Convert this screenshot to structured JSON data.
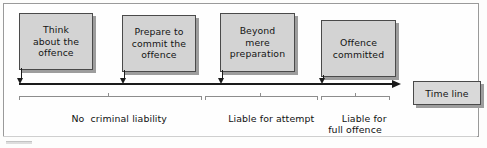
{
  "diagram": {
    "frame": {
      "border_color": "#9a9a9a",
      "background": "#fefefe"
    },
    "box_fill": "#d3d3d3",
    "box_border": "#4a4a4a",
    "shadow_color": "#9d9d9d",
    "line_color": "#1a1a1a",
    "brace_color": "#8d8d8d",
    "stages": [
      {
        "id": "think",
        "line1": "Think",
        "line2": "about the",
        "line3": "offence"
      },
      {
        "id": "prepare",
        "line1": "Prepare to",
        "line2": "commit the",
        "line3": "offence"
      },
      {
        "id": "beyond",
        "line1": "Beyond",
        "line2": "mere",
        "line3": "preparation"
      },
      {
        "id": "committed",
        "line1": "Offence",
        "line2": "committed",
        "line3": ""
      }
    ],
    "timeline_label": "Time line",
    "segments": [
      {
        "id": "no-liability",
        "line1": "No  criminal liability",
        "line2": ""
      },
      {
        "id": "attempt",
        "line1": "Liable for attempt",
        "line2": ""
      },
      {
        "id": "full-offence",
        "line1": "Liable for",
        "line2": "full offence"
      }
    ]
  }
}
